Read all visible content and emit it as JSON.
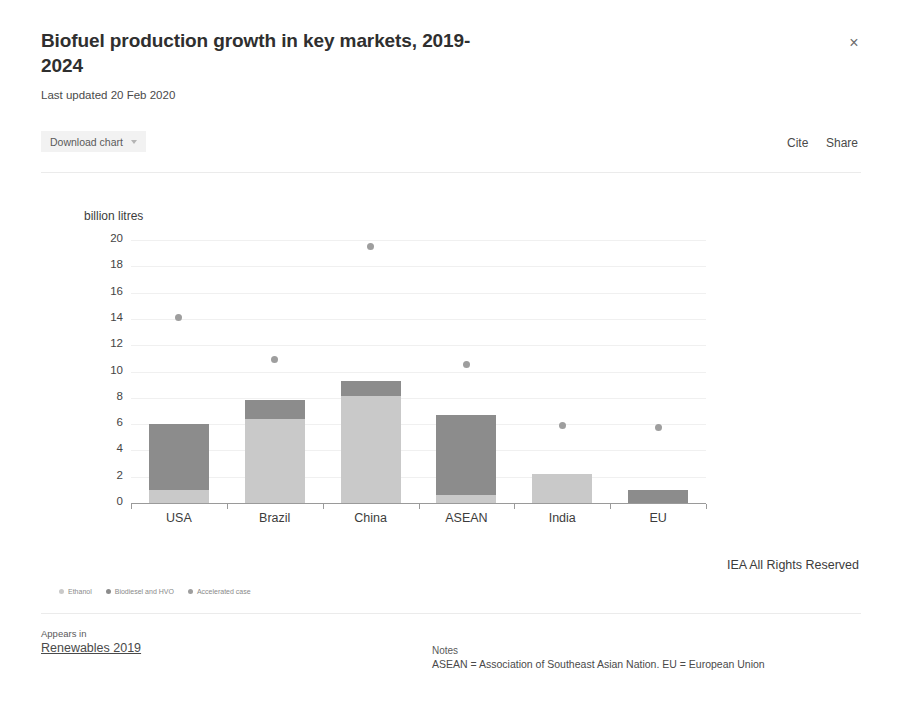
{
  "header": {
    "title": "Biofuel production growth in key markets, 2019-2024",
    "subtitle": "Last updated 20 Feb 2020",
    "close_label": "×"
  },
  "toolbar": {
    "download_label": "Download chart",
    "cite_label": "Cite",
    "share_label": "Share"
  },
  "footer": {
    "appears_in_label": "Appears in",
    "appears_in_link": "Renewables 2019",
    "notes_label": "Notes",
    "notes_text": "ASEAN = Association of Southeast Asian Nation. EU = European Union"
  },
  "rights": "IEA All Rights Reserved",
  "colors": {
    "ethanol": "#c9c9c9",
    "biodiesel": "#8c8c8c",
    "accelerated": "#9e9e9e",
    "grid": "#f0f0f0",
    "axis": "#9a9a9a"
  },
  "chart_data": {
    "type": "bar",
    "title": "Biofuel production growth in key markets, 2019-2024",
    "xlabel": "",
    "ylabel": "billion litres",
    "ylim": [
      0,
      20
    ],
    "yticks": [
      0,
      2,
      4,
      6,
      8,
      10,
      12,
      14,
      16,
      18,
      20
    ],
    "ytick_labels": [
      "0",
      "2",
      "4",
      "6",
      "8",
      "10",
      "12",
      "14",
      "16",
      "18",
      "20"
    ],
    "grid": true,
    "stacked": true,
    "legend_position": "bottom-left",
    "categories": [
      "USA",
      "Brazil",
      "China",
      "ASEAN",
      "India",
      "EU"
    ],
    "series": [
      {
        "name": "Ethanol",
        "type": "bar",
        "color": "#c9c9c9",
        "values": [
          1.0,
          6.4,
          8.1,
          0.6,
          2.2,
          0.0
        ]
      },
      {
        "name": "Biodiesel and HVO",
        "type": "bar",
        "color": "#8c8c8c",
        "values": [
          5.0,
          1.4,
          1.2,
          6.1,
          0.0,
          1.0
        ]
      },
      {
        "name": "Accelerated case",
        "type": "scatter",
        "color": "#9e9e9e",
        "values": [
          14.1,
          10.9,
          19.5,
          10.5,
          5.9,
          5.75
        ]
      }
    ],
    "totals": [
      6.0,
      7.8,
      9.3,
      6.7,
      2.2,
      1.0
    ],
    "annotations": [
      "IEA All Rights Reserved"
    ],
    "notes": "ASEAN = Association of Southeast Asian Nation. EU = European Union"
  }
}
